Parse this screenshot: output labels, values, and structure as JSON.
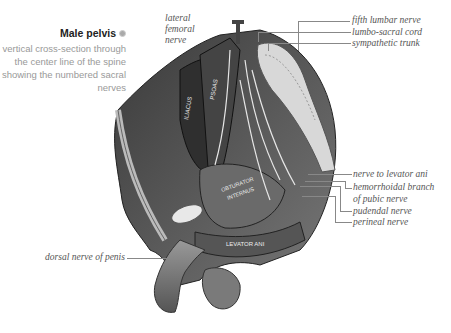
{
  "header": {
    "title": "Male pelvis",
    "title_icon": "dot-icon",
    "caption_bullet": "•",
    "caption": "vertical cross-section through the center line of the spine showing the numbered sacral nerves"
  },
  "illustration": {
    "muscle_labels": [
      "ILIACUS",
      "PSOAS",
      "OBTURATOR INTERNUS",
      "LEVATOR ANI"
    ],
    "labels_top_left": [
      "lateral",
      "femoral",
      "nerve"
    ],
    "labels_top_right": [
      "fifth lumbar nerve",
      "lumbo-sacral cord",
      "sympathetic trunk"
    ],
    "labels_right": [
      "nerve to levator ani",
      "hemorrhoidal branch",
      "of pubic nerve",
      "pudendal nerve",
      "perineal nerve"
    ],
    "label_bottom_left": "dorsal nerve of penis"
  }
}
